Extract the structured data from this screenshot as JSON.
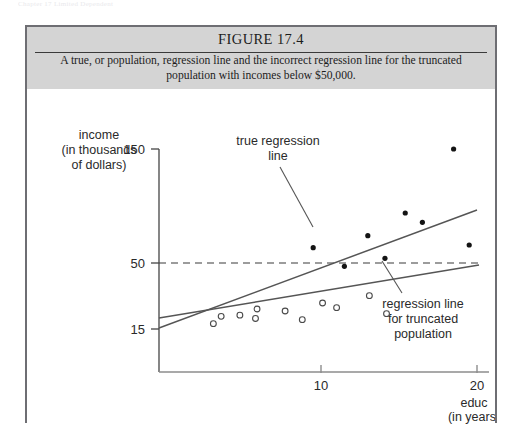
{
  "page": {
    "running_header": "Chapter 17  Limited Dependent"
  },
  "figure": {
    "number_label": "FIGURE 17.4",
    "caption": "A true, or population, regression line and the incorrect regression line for the truncated population with incomes below $50,000.",
    "border_color": "#6e6e73",
    "caption_band_color": "#d4d4d4"
  },
  "chart_data": {
    "type": "scatter",
    "title": "FIGURE 17.4",
    "subtitle": "A true, or population, regression line and the incorrect regression line for the truncated population with incomes below $50,000.",
    "xlabel": "educ",
    "xlabel_sub": "(in years)",
    "ylabel": "income",
    "ylabel_sub1": "(in thousands",
    "ylabel_sub2": "of dollars)",
    "xlim": [
      0,
      22.5
    ],
    "ylim": [
      0,
      175
    ],
    "xticks": [
      10,
      20
    ],
    "xticklabels": [
      "10",
      "20"
    ],
    "yticks": [
      15,
      50,
      150
    ],
    "yticklabels": [
      "15",
      "50",
      "150"
    ],
    "grid": false,
    "legend": "none",
    "truncation_threshold": 50,
    "truncation_line_style": "dashed",
    "series": [
      {
        "name": "truncated sample (income below $50,000)",
        "marker": "open-circle",
        "marker_color": "#4a4a4a",
        "points": [
          {
            "x": 3.1,
            "y": 19.0
          },
          {
            "x": 3.6,
            "y": 24.5
          },
          {
            "x": 4.8,
            "y": 25.4
          },
          {
            "x": 5.9,
            "y": 30.0
          },
          {
            "x": 5.8,
            "y": 22.9
          },
          {
            "x": 7.7,
            "y": 28.5
          },
          {
            "x": 8.8,
            "y": 22.0
          },
          {
            "x": 10.1,
            "y": 34.5
          },
          {
            "x": 11.0,
            "y": 31.0
          },
          {
            "x": 13.1,
            "y": 40.0
          },
          {
            "x": 14.2,
            "y": 26.5
          }
        ]
      },
      {
        "name": "observations above $50,000 (excluded by truncation)",
        "marker": "filled-circle",
        "marker_color": "#141414",
        "points": [
          {
            "x": 11.5,
            "y": 62.0
          },
          {
            "x": 13.0,
            "y": 85.0
          },
          {
            "x": 14.1,
            "y": 68.0
          },
          {
            "x": 15.4,
            "y": 102.0
          },
          {
            "x": 16.5,
            "y": 95.0
          },
          {
            "x": 18.5,
            "y": 150.0
          },
          {
            "x": 19.5,
            "y": 78.0
          },
          {
            "x": 9.5,
            "y": 76.0
          }
        ]
      }
    ],
    "lines": [
      {
        "name": "true regression line",
        "x0": 0.0,
        "y0": 15.8,
        "x1": 20.4,
        "y1": 88.0,
        "style": "solid",
        "color": "#555555"
      },
      {
        "name": "regression line for truncated population",
        "x0": 0.0,
        "y0": 20.8,
        "x1": 20.4,
        "y1": 50.0,
        "style": "solid",
        "color": "#555555"
      },
      {
        "name": "truncation threshold",
        "x0": 0.0,
        "y0": 50.0,
        "x1": 20.7,
        "y1": 50.0,
        "style": "dashed",
        "color": "#3a3a3a"
      }
    ],
    "annotations": [
      {
        "name": "true-regression-line-annotation",
        "line1": "true regression",
        "line2": "line"
      },
      {
        "name": "truncated-regression-line-annotation",
        "line1": "regression line",
        "line2": "for truncated",
        "line3": "population"
      }
    ]
  }
}
